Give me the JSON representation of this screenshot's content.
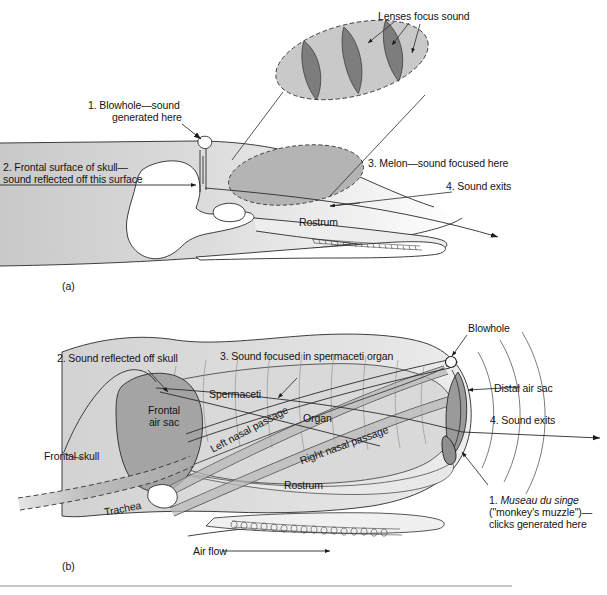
{
  "figure": {
    "domain": "diagram",
    "panels": [
      {
        "id": "a",
        "caption": "(a)",
        "subject": "dolphin head showing blowhole, skull, melon and sound path"
      },
      {
        "id": "b",
        "caption": "(b)",
        "subject": "sperm whale head showing spermaceti organ, air sacs and sound path"
      }
    ]
  },
  "panel_a": {
    "caption": "(a)",
    "labels": {
      "lenses": "Lenses focus sound",
      "blowhole_line1": "1. Blowhole—sound",
      "blowhole_line2": "generated here",
      "frontal_line1": "2. Frontal surface of skull—",
      "frontal_line2": "sound reflected off this surface",
      "melon": "3. Melon—sound focused here",
      "sound_exits": "4. Sound exits",
      "rostrum": "Rostrum"
    },
    "numbered_steps": [
      {
        "number": "1.",
        "text": "Blowhole—sound generated here"
      },
      {
        "number": "2.",
        "text": "Frontal surface of skull—sound reflected off this surface"
      },
      {
        "number": "3.",
        "text": "Melon—sound focused here"
      },
      {
        "number": "4.",
        "text": "Sound exits"
      }
    ],
    "inset": {
      "name": "melon-lenses-inset",
      "lens_count": 3,
      "leader_count": 3
    }
  },
  "panel_b": {
    "caption": "(b)",
    "labels": {
      "blowhole": "Blowhole",
      "reflected": "2. Sound reflected off skull",
      "focused": "3. Sound focused in spermaceti organ",
      "distal_air_sac": "Distal air sac",
      "sound_exits": "4. Sound exits",
      "spermaceti": "Spermaceti",
      "organ": "Organ",
      "left_nasal": "Left nasal passage",
      "right_nasal": "Right nasal passage",
      "frontal_air_sac_line1": "Frontal",
      "frontal_air_sac_line2": "air sac",
      "frontal_skull": "Frontal skull",
      "trachea": "Trachea",
      "rostrum": "Rostrum",
      "air_flow": "Air flow",
      "museau_line1_num": "1. ",
      "museau_line1_italic": "Museau du singe",
      "museau_line2": "(\"monkey's muzzle\")—",
      "museau_line3": "clicks generated here"
    },
    "numbered_steps": [
      {
        "number": "1.",
        "text": "Museau du singe (\"monkey's muzzle\")—clicks generated here"
      },
      {
        "number": "2.",
        "text": "Sound reflected off skull"
      },
      {
        "number": "3.",
        "text": "Sound focused in spermaceti organ"
      },
      {
        "number": "4.",
        "text": "Sound exits"
      }
    ]
  },
  "colors": {
    "body_gray": "#d3d3d3",
    "melon_gray": "#b2b2b2",
    "lens_dark": "#7d7d7d",
    "inset_light": "#c9c9c9",
    "air_sac_gray": "#a4a4a4",
    "organ_gray": "#d8d8d8",
    "passage_gray": "#b8b8b8",
    "line": "#1a1a1a",
    "text": "#141414",
    "rule": "#8a8a8a",
    "white": "#ffffff"
  }
}
